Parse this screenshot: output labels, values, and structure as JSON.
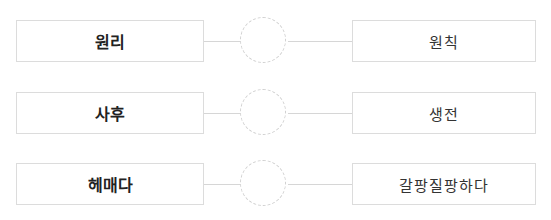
{
  "pairs": [
    {
      "left": "원리",
      "right": "원칙"
    },
    {
      "left": "사후",
      "right": "생전"
    },
    {
      "left": "헤매다",
      "right": "갈팡질팡하다"
    }
  ],
  "colors": {
    "border": "#dcdcdc",
    "line": "#d6d6d6",
    "circle_dash": "#d0d0d0",
    "text": "#222222"
  }
}
